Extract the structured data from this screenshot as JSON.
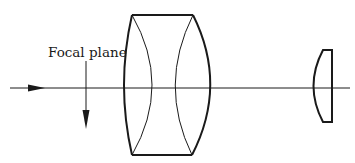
{
  "labels": {
    "focal_plane": "Focal plane"
  },
  "colors": {
    "stroke": "#1a1a1a",
    "background": "#ffffff"
  },
  "elements": {
    "optical_axis": "optical axis with incoming light-direction arrow",
    "focal_plane_marker": "downward arrow marking focal plane",
    "thick_lens": "thick meniscus-style lens element with two inner curved surfaces",
    "small_lens": "small plano-convex lens element"
  }
}
